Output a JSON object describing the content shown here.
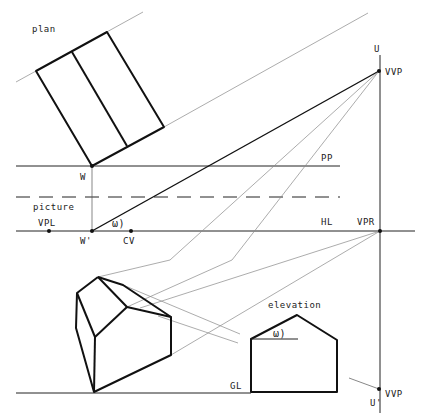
{
  "diagram": {
    "labels": {
      "plan": "plan",
      "picture": "picture",
      "elevation": "elevation",
      "pp": "PP",
      "hl": "HL",
      "gl": "GL",
      "w": "W",
      "w_prime": "W'",
      "vpl": "VPL",
      "cv": "CV",
      "vpr": "VPR",
      "u": "U",
      "u_prime": "U'",
      "vvp_top": "VVP",
      "vvp_bottom": "VVP",
      "omega_picture": "ω)",
      "omega_elevation": "ω)"
    },
    "colors": {
      "ink": "#111111",
      "construction": "#888888",
      "background": "#ffffff"
    }
  }
}
